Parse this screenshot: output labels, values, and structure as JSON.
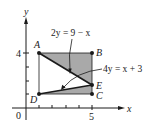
{
  "figure": {
    "axes": {
      "x_label": "x",
      "y_label": "y",
      "origin_label": "0",
      "x_tick_label": "5",
      "y_tick_label": "4"
    },
    "points": [
      {
        "label": "A",
        "coords": [
          1,
          4
        ]
      },
      {
        "label": "B",
        "coords": [
          5,
          4
        ]
      },
      {
        "label": "C",
        "coords": [
          5,
          1
        ]
      },
      {
        "label": "D",
        "coords": [
          1,
          1
        ]
      },
      {
        "label": "E",
        "coords": [
          5,
          2
        ]
      }
    ],
    "curves": [
      {
        "equation": "2y = 9 − x",
        "through": [
          "A",
          "E"
        ]
      },
      {
        "equation": "4y = x + 3",
        "through": [
          "D",
          "E"
        ]
      }
    ],
    "shaded_regions": [
      [
        "A",
        "B",
        "E"
      ],
      [
        "D",
        "E",
        "C"
      ]
    ],
    "colors": {
      "shade": "#a9a9a9",
      "ink": "#1a1a1a",
      "background": "#ffffff"
    }
  }
}
